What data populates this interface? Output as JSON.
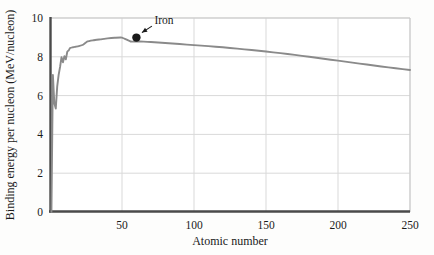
{
  "figure": {
    "background_color": "#fdfdfc",
    "plot_border_color": "#c9c9c9",
    "axis_color": "#4a4a4a",
    "grid_color": "#d9d9d9",
    "curve_color": "#8a8a8a",
    "marker_color": "#1a1a1a",
    "text_color": "#1a1a1a"
  },
  "chart_data": {
    "type": "line",
    "title": "",
    "xlabel": "Atomic number",
    "ylabel": "Binding energy per nucleon (MeV/nucleon)",
    "xlim": [
      0,
      250
    ],
    "ylim": [
      0,
      10
    ],
    "xticks": [
      0,
      50,
      100,
      150,
      200,
      250
    ],
    "xtick_labels": [
      "",
      "50",
      "100",
      "150",
      "200",
      "250"
    ],
    "yticks": [
      0,
      2,
      4,
      6,
      8,
      10
    ],
    "ytick_labels": [
      "0",
      "2",
      "4",
      "6",
      "8",
      "10"
    ],
    "grid": true,
    "legend": "none",
    "series": [
      {
        "name": "Binding energy per nucleon",
        "color": "#8a8a8a",
        "x": [
          1,
          2,
          3,
          4,
          5,
          6,
          7,
          8,
          9,
          10,
          11,
          12,
          13,
          14,
          16,
          18,
          20,
          23,
          26,
          30,
          35,
          40,
          45,
          50,
          56,
          60,
          65,
          70,
          80,
          90,
          100,
          110,
          120,
          130,
          140,
          150,
          160,
          170,
          180,
          190,
          200,
          210,
          220,
          230,
          240,
          250
        ],
        "y": [
          0.0,
          7.07,
          5.6,
          5.33,
          6.46,
          7.07,
          7.48,
          7.98,
          7.72,
          8.03,
          7.87,
          8.26,
          8.33,
          8.45,
          8.49,
          8.52,
          8.55,
          8.62,
          8.79,
          8.85,
          8.9,
          8.95,
          8.98,
          8.99,
          8.79,
          8.79,
          8.78,
          8.76,
          8.71,
          8.66,
          8.6,
          8.55,
          8.49,
          8.42,
          8.35,
          8.27,
          8.19,
          8.1,
          8.0,
          7.9,
          7.8,
          7.7,
          7.6,
          7.5,
          7.41,
          7.32
        ]
      }
    ],
    "annotations": [
      {
        "label": "Iron",
        "point_x": 60,
        "point_y": 8.99,
        "marker": "filled-circle",
        "arrow": true,
        "label_offset_x": 18,
        "label_offset_y": -14
      }
    ]
  }
}
